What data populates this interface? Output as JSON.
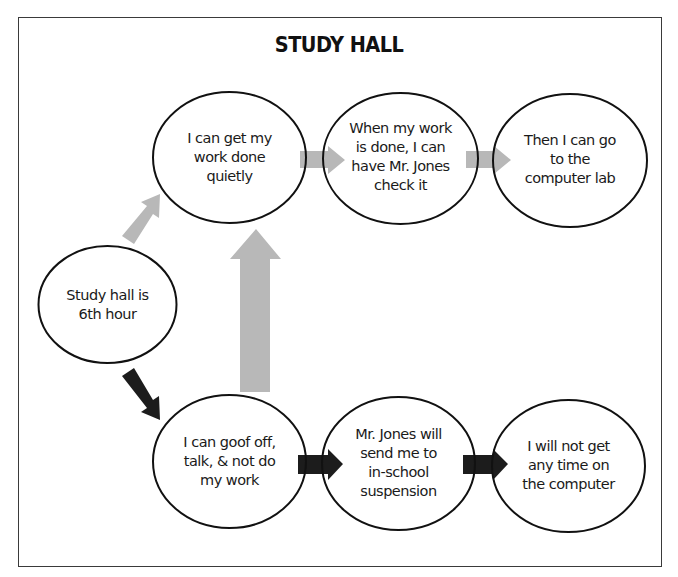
{
  "title": "STUDY HALL",
  "colors": {
    "positive_arrow": "#b8b8b8",
    "negative_arrow": "#1c1c1c",
    "outline": "#111111",
    "frame": "#3a3a3a"
  },
  "nodes": {
    "start": {
      "text": "Study hall is\n6th hour"
    },
    "top": [
      {
        "text": "I can get my\nwork done\nquietly"
      },
      {
        "text": "When my work\nis done, I can\nhave Mr. Jones\ncheck it"
      },
      {
        "text": "Then I can go\nto the\ncomputer lab"
      }
    ],
    "bottom": [
      {
        "text": "I can goof off,\ntalk, & not do\nmy work"
      },
      {
        "text": "Mr. Jones will\nsend me to\nin-school\nsuspension"
      },
      {
        "text": "I will not get\nany time on\nthe computer"
      }
    ]
  },
  "edges": [
    {
      "from": "start",
      "to": "top.0",
      "style": "gray"
    },
    {
      "from": "top.0",
      "to": "top.1",
      "style": "gray"
    },
    {
      "from": "top.1",
      "to": "top.2",
      "style": "gray"
    },
    {
      "from": "start",
      "to": "bottom.0",
      "style": "black"
    },
    {
      "from": "bottom.0",
      "to": "bottom.1",
      "style": "black"
    },
    {
      "from": "bottom.1",
      "to": "bottom.2",
      "style": "black"
    },
    {
      "from": "bottom.0",
      "to": "top.0",
      "style": "gray-large"
    }
  ]
}
